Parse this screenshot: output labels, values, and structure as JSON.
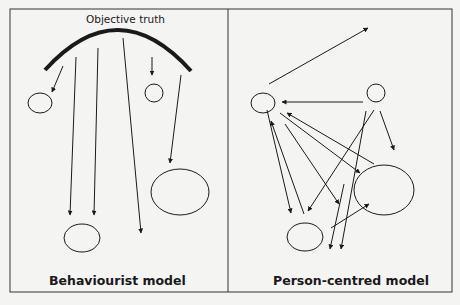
{
  "diagram": {
    "colors": {
      "background": "#f4f4f2",
      "stroke": "#1a1a1a",
      "frame": "#333333"
    },
    "frame": {
      "x": 10,
      "y": 9,
      "width": 442,
      "height": 283,
      "divider_x": 228
    },
    "left_panel": {
      "title": "Behaviourist model",
      "top_label": "Objective truth",
      "arc": {
        "from": [
          45,
          70
        ],
        "peak": [
          118,
          30
        ],
        "to": [
          191,
          71
        ],
        "stroke_width": 4
      },
      "ellipses": [
        {
          "cx": 40,
          "cy": 103,
          "rx": 12,
          "ry": 10
        },
        {
          "cx": 154,
          "cy": 93,
          "rx": 9,
          "ry": 9
        },
        {
          "cx": 180,
          "cy": 192,
          "rx": 29,
          "ry": 23
        },
        {
          "cx": 82,
          "cy": 238,
          "rx": 18,
          "ry": 14
        }
      ],
      "arrows": [
        {
          "from": [
            63,
            66
          ],
          "to": [
            52,
            92
          ]
        },
        {
          "from": [
            152,
            57
          ],
          "to": [
            152,
            75
          ]
        },
        {
          "from": [
            76,
            57
          ],
          "to": [
            70,
            215
          ]
        },
        {
          "from": [
            98,
            48
          ],
          "to": [
            94,
            215
          ]
        },
        {
          "from": [
            123,
            38
          ],
          "to": [
            141,
            233
          ]
        },
        {
          "from": [
            181,
            75
          ],
          "to": [
            170,
            163
          ]
        }
      ]
    },
    "right_panel": {
      "title": "Person-centred model",
      "ellipses": [
        {
          "cx": 263,
          "cy": 103,
          "rx": 12,
          "ry": 10
        },
        {
          "cx": 376,
          "cy": 93,
          "rx": 9,
          "ry": 9
        },
        {
          "cx": 384,
          "cy": 190,
          "rx": 30,
          "ry": 25
        },
        {
          "cx": 305,
          "cy": 237,
          "rx": 18,
          "ry": 14
        }
      ],
      "arrows": [
        {
          "from": [
            269,
            84
          ],
          "to": [
            368,
            28
          ]
        },
        {
          "from": [
            363,
            102
          ],
          "to": [
            282,
            102
          ]
        },
        {
          "from": [
            374,
            110
          ],
          "to": [
            308,
            211
          ]
        },
        {
          "from": [
            366,
            111
          ],
          "to": [
            341,
            249
          ]
        },
        {
          "from": [
            380,
            111
          ],
          "to": [
            394,
            150
          ]
        },
        {
          "from": [
            374,
            164
          ],
          "to": [
            287,
            113
          ]
        },
        {
          "from": [
            280,
            113
          ],
          "to": [
            360,
            173
          ]
        },
        {
          "from": [
            285,
            124
          ],
          "to": [
            339,
            204
          ]
        },
        {
          "from": [
            267,
            110
          ],
          "to": [
            291,
            213
          ]
        },
        {
          "from": [
            304,
            214
          ],
          "to": [
            271,
            121
          ]
        },
        {
          "from": [
            331,
            228
          ],
          "to": [
            369,
            204
          ]
        },
        {
          "from": [
            344,
            184
          ],
          "to": [
            330,
            249
          ]
        }
      ]
    }
  }
}
